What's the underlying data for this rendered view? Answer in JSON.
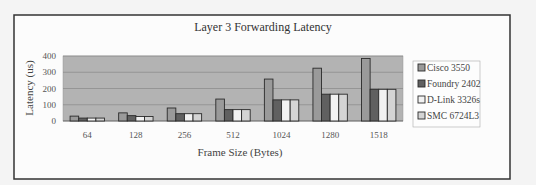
{
  "chart_data": {
    "type": "bar",
    "title": "Layer 3 Forwarding Latency",
    "xlabel": "Frame Size (Bytes)",
    "ylabel": "Latency (us)",
    "ylim": [
      0,
      400
    ],
    "yticks": [
      "0",
      "100",
      "200",
      "300",
      "400"
    ],
    "grid": true,
    "legend_position": "right",
    "categories": [
      "64",
      "128",
      "256",
      "512",
      "1024",
      "1280",
      "1518"
    ],
    "series": [
      {
        "name": "Cisco 3550",
        "color": "#9a9a9a",
        "values": [
          30,
          50,
          80,
          135,
          258,
          325,
          385
        ]
      },
      {
        "name": "Foundry 2402",
        "color": "#606060",
        "values": [
          18,
          33,
          45,
          70,
          130,
          165,
          195
        ]
      },
      {
        "name": "D-Link 3326s",
        "color": "#f2f2f2",
        "values": [
          18,
          28,
          45,
          70,
          130,
          165,
          195
        ]
      },
      {
        "name": "SMC 6724L3",
        "color": "#d4d4d4",
        "values": [
          18,
          28,
          45,
          70,
          130,
          165,
          195
        ]
      }
    ],
    "plot_background": "#b3b3b3"
  }
}
